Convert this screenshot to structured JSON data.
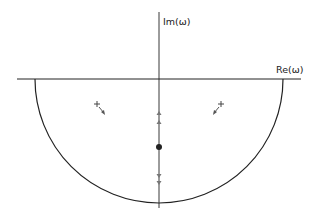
{
  "diagram": {
    "axes": {
      "imag_label": "Im(ω)",
      "real_label": "Re(ω)"
    },
    "contour": {
      "type": "lower-half semicircle",
      "color": "#222222"
    },
    "markers": {
      "poles": [
        "+",
        "+"
      ],
      "center_point": "filled-dot",
      "imag_axis_arrows": [
        "up-triangle",
        "up-triangle",
        "down-triangle",
        "down-triangle"
      ]
    }
  }
}
